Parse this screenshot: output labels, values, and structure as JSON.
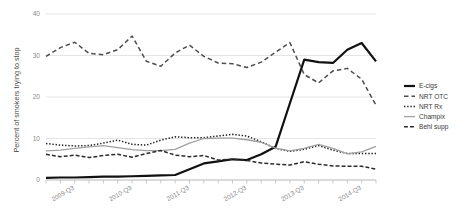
{
  "chart_data": {
    "type": "line",
    "title": "",
    "xlabel": "",
    "ylabel": "Percent of smokers trying to stop",
    "ylim": [
      0,
      40
    ],
    "yticks": [
      0,
      10,
      20,
      30,
      40
    ],
    "grid": true,
    "legend_position": "right",
    "x": [
      "2009-Q1",
      "2009-Q2",
      "2009-Q3",
      "2009-Q4",
      "2010-Q1",
      "2010-Q2",
      "2010-Q3",
      "2010-Q4",
      "2011-Q1",
      "2011-Q2",
      "2011-Q3",
      "2011-Q4",
      "2012-Q1",
      "2012-Q2",
      "2012-Q3",
      "2012-Q4",
      "2013-Q1",
      "2013-Q2",
      "2013-Q3",
      "2013-Q4",
      "2014-Q1",
      "2014-Q2",
      "2014-Q3",
      "2014-Q4"
    ],
    "xtick_labels": [
      "2009-Q3",
      "2010-Q3",
      "2011-Q3",
      "2012-Q3",
      "2013-Q3",
      "2014-Q3"
    ],
    "xtick_indices": [
      2,
      6,
      10,
      14,
      18,
      22
    ],
    "series": [
      {
        "name": "E-cigs",
        "style": "solid",
        "color": "#111111",
        "width": 2.2,
        "values": [
          0.5,
          0.6,
          0.6,
          0.7,
          0.8,
          0.8,
          0.9,
          1.0,
          1.1,
          1.2,
          2.6,
          4.0,
          4.5,
          5.0,
          4.8,
          6.2,
          8.0,
          18.5,
          29.0,
          28.4,
          28.2,
          31.4,
          33.0,
          28.6
        ]
      },
      {
        "name": "NRT OTC",
        "style": "dashed",
        "color": "#4d4d4d",
        "width": 1.5,
        "values": [
          29.8,
          31.9,
          33.2,
          30.5,
          30.2,
          31.4,
          34.7,
          28.6,
          27.4,
          30.6,
          32.5,
          29.8,
          28.2,
          28.0,
          27.1,
          28.4,
          30.8,
          33.1,
          25.4,
          23.4,
          26.3,
          26.9,
          24.3,
          18.0
        ]
      },
      {
        "name": "NRT Rx",
        "style": "dotted",
        "color": "#1f1f1f",
        "width": 1.5,
        "values": [
          8.8,
          8.4,
          8.2,
          8.3,
          8.9,
          9.6,
          8.6,
          8.4,
          9.6,
          10.4,
          10.2,
          10.2,
          10.6,
          11.0,
          10.6,
          9.2,
          7.6,
          6.9,
          7.4,
          8.3,
          7.2,
          6.4,
          6.4,
          6.4
        ]
      },
      {
        "name": "Champix",
        "style": "solid-thin",
        "color": "#a0a0a0",
        "width": 1.3,
        "values": [
          7.0,
          7.2,
          7.6,
          8.0,
          8.3,
          7.8,
          7.3,
          7.1,
          7.1,
          7.4,
          8.9,
          10.0,
          10.1,
          10.1,
          9.7,
          9.1,
          7.7,
          7.0,
          7.6,
          8.6,
          7.6,
          6.3,
          6.8,
          8.1
        ]
      },
      {
        "name": "Behl supp",
        "style": "dashdot",
        "color": "#2b2b2b",
        "width": 1.5,
        "values": [
          6.2,
          5.6,
          6.0,
          5.4,
          5.9,
          6.2,
          5.5,
          6.4,
          7.1,
          6.0,
          5.6,
          5.9,
          4.8,
          5.0,
          4.7,
          4.1,
          3.8,
          3.6,
          4.4,
          3.8,
          3.4,
          3.3,
          3.3,
          2.6
        ]
      }
    ]
  },
  "legend": {
    "items": [
      {
        "label": "E-cigs"
      },
      {
        "label": "NRT OTC"
      },
      {
        "label": "NRT Rx"
      },
      {
        "label": "Champix"
      },
      {
        "label": "Behl supp"
      }
    ]
  }
}
